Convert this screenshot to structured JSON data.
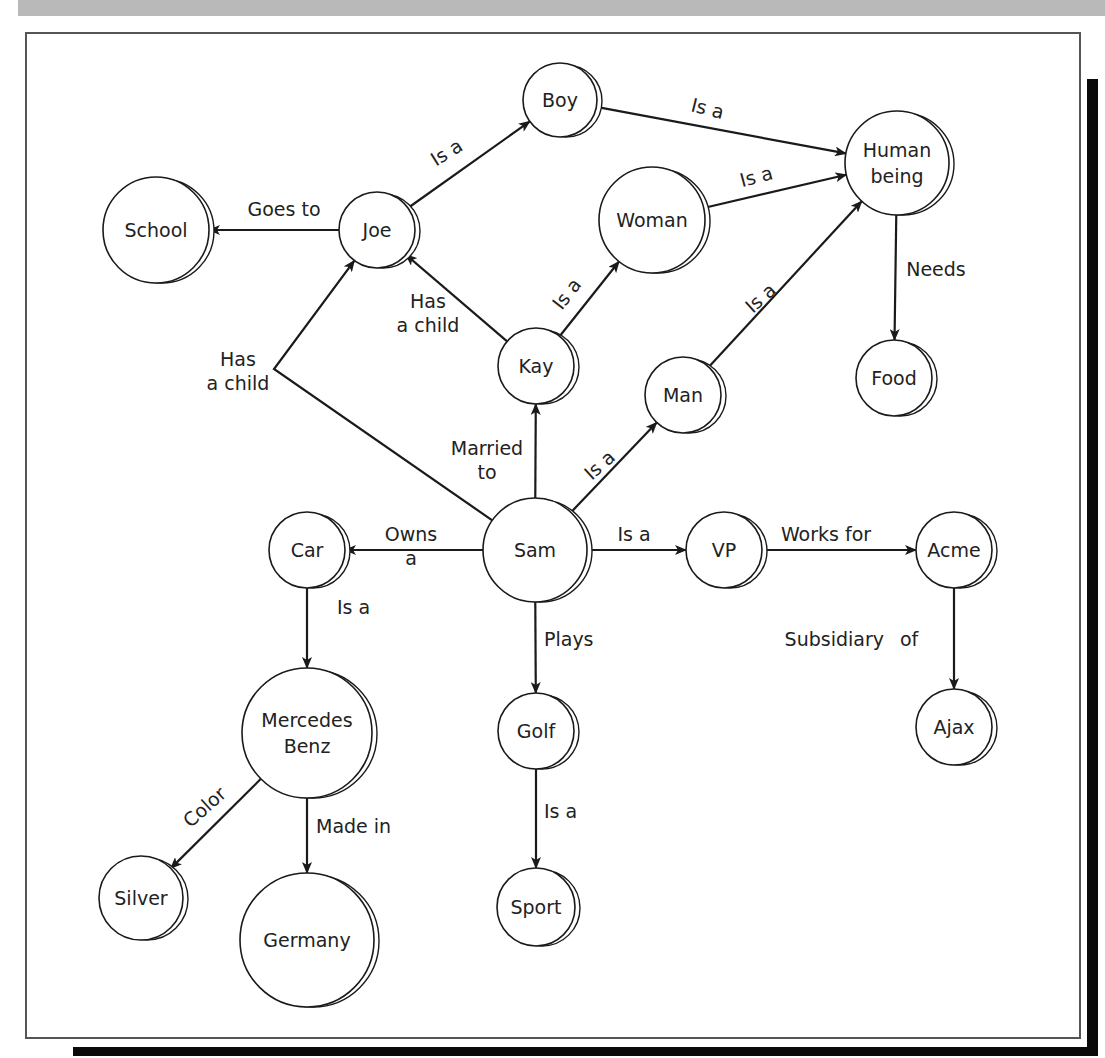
{
  "figure": {
    "header_text": "",
    "colors": {
      "stroke": "#1a1a1a",
      "text": "#222222",
      "header": "#b9b9b9",
      "shadow": "#0a0a0a"
    }
  },
  "nodes": [
    {
      "id": "school",
      "lines": [
        "School"
      ],
      "x": 156,
      "y": 230,
      "r": 53
    },
    {
      "id": "joe",
      "lines": [
        "Joe"
      ],
      "x": 377,
      "y": 230,
      "r": 38
    },
    {
      "id": "boy",
      "lines": [
        "Boy"
      ],
      "x": 560,
      "y": 100,
      "r": 37
    },
    {
      "id": "woman",
      "lines": [
        "Woman"
      ],
      "x": 652,
      "y": 220,
      "r": 53
    },
    {
      "id": "human",
      "lines": [
        "Human",
        "being"
      ],
      "x": 897,
      "y": 163,
      "r": 52
    },
    {
      "id": "kay",
      "lines": [
        "Kay"
      ],
      "x": 536,
      "y": 366,
      "r": 38
    },
    {
      "id": "man",
      "lines": [
        "Man"
      ],
      "x": 683,
      "y": 395,
      "r": 38
    },
    {
      "id": "food",
      "lines": [
        "Food"
      ],
      "x": 894,
      "y": 378,
      "r": 38
    },
    {
      "id": "car",
      "lines": [
        "Car"
      ],
      "x": 307,
      "y": 550,
      "r": 38
    },
    {
      "id": "sam",
      "lines": [
        "Sam"
      ],
      "x": 535,
      "y": 550,
      "r": 52
    },
    {
      "id": "vp",
      "lines": [
        "VP"
      ],
      "x": 724,
      "y": 550,
      "r": 38
    },
    {
      "id": "acme",
      "lines": [
        "Acme"
      ],
      "x": 954,
      "y": 550,
      "r": 38
    },
    {
      "id": "ajax",
      "lines": [
        "Ajax"
      ],
      "x": 954,
      "y": 727,
      "r": 38
    },
    {
      "id": "mercedes",
      "lines": [
        "Mercedes",
        "Benz"
      ],
      "x": 307,
      "y": 733,
      "r": 65
    },
    {
      "id": "golf",
      "lines": [
        "Golf"
      ],
      "x": 536,
      "y": 731,
      "r": 38
    },
    {
      "id": "silver",
      "lines": [
        "Silver"
      ],
      "x": 141,
      "y": 898,
      "r": 42
    },
    {
      "id": "germany",
      "lines": [
        "Germany"
      ],
      "x": 307,
      "y": 940,
      "r": 67
    },
    {
      "id": "sport",
      "lines": [
        "Sport"
      ],
      "x": 536,
      "y": 907,
      "r": 39
    }
  ],
  "edges": [
    {
      "from": "joe",
      "to": "school",
      "label": [
        "Goes to"
      ],
      "lx": 284,
      "ly": 216,
      "rot": 0
    },
    {
      "from": "joe",
      "to": "boy",
      "label": [
        "Is a"
      ],
      "lx": 450,
      "ly": 158,
      "rot": -32
    },
    {
      "from": "boy",
      "to": "human",
      "label": [
        "Is a"
      ],
      "lx": 706,
      "ly": 115,
      "rot": 14
    },
    {
      "from": "woman",
      "to": "human",
      "label": [
        "Is a"
      ],
      "lx": 758,
      "ly": 183,
      "rot": -15
    },
    {
      "from": "kay",
      "to": "joe",
      "label": [
        "Has",
        "a child"
      ],
      "lx": 428,
      "ly": 308,
      "rot": 0
    },
    {
      "from": "kay",
      "to": "woman",
      "label": [
        "Is a"
      ],
      "lx": 572,
      "ly": 298,
      "rot": -52
    },
    {
      "from": "man",
      "to": "human",
      "label": [
        "Is a"
      ],
      "lx": 765,
      "ly": 303,
      "rot": -42
    },
    {
      "from": "human",
      "to": "food",
      "label": [
        "Needs"
      ],
      "lx": 936,
      "ly": 276,
      "rot": 0
    },
    {
      "from": "sam",
      "to": "joe",
      "via": [
        274,
        369
      ],
      "label": [
        "Has",
        "a child"
      ],
      "lx": 238,
      "ly": 366,
      "rot": 0
    },
    {
      "from": "sam",
      "to": "kay",
      "label": [
        "Married",
        "to"
      ],
      "lx": 487,
      "ly": 455,
      "rot": 0
    },
    {
      "from": "sam",
      "to": "man",
      "label": [
        "Is a"
      ],
      "lx": 604,
      "ly": 470,
      "rot": -42
    },
    {
      "from": "sam",
      "to": "car",
      "label": [
        "Owns",
        "a"
      ],
      "lx": 411,
      "ly": 541,
      "rot": 0
    },
    {
      "from": "sam",
      "to": "vp",
      "label": [
        "Is a"
      ],
      "lx": 634,
      "ly": 541,
      "rot": 0
    },
    {
      "from": "vp",
      "to": "acme",
      "label": [
        "Works for"
      ],
      "lx": 826,
      "ly": 541,
      "rot": 0
    },
    {
      "from": "acme",
      "to": "ajax",
      "label": [
        "Subsidiary",
        "of"
      ],
      "lx": 888,
      "ly": 646,
      "rot": 0,
      "split": true
    },
    {
      "from": "car",
      "to": "mercedes",
      "label": [
        "Is a"
      ],
      "lx": 337,
      "ly": 614,
      "rot": 0,
      "anchor": "start"
    },
    {
      "from": "sam",
      "to": "golf",
      "label": [
        "Plays"
      ],
      "lx": 544,
      "ly": 646,
      "rot": 0,
      "anchor": "start"
    },
    {
      "from": "golf",
      "to": "sport",
      "label": [
        "Is a"
      ],
      "lx": 544,
      "ly": 818,
      "rot": 0,
      "anchor": "start"
    },
    {
      "from": "mercedes",
      "to": "silver",
      "label": [
        "Color"
      ],
      "lx": 209,
      "ly": 812,
      "rot": -42
    },
    {
      "from": "mercedes",
      "to": "germany",
      "label": [
        "Made in"
      ],
      "lx": 316,
      "ly": 833,
      "rot": 0,
      "anchor": "start"
    }
  ]
}
